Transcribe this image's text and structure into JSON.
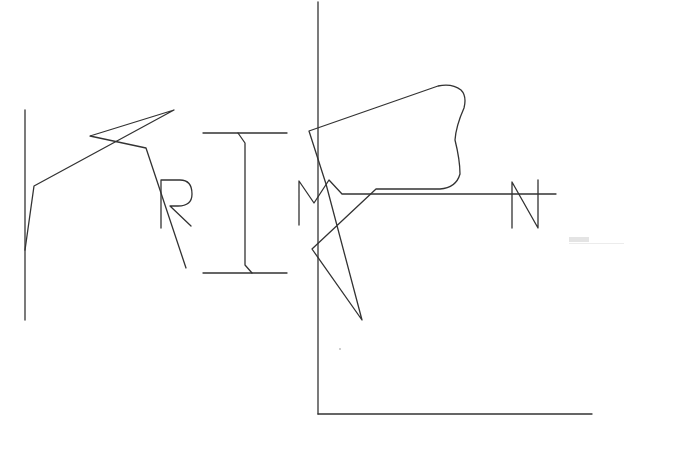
{
  "canvas": {
    "width": 700,
    "height": 458,
    "background": "#ffffff",
    "stroke_color": "#333333",
    "stroke_width": 1.3
  },
  "strokes": [
    {
      "name": "left-vertical-line",
      "d": "M25 110 L25 320"
    },
    {
      "name": "left-zigzag-stroke",
      "d": "M25 250 L34 186 L174 110 L90 136 L146 148 L186 268"
    },
    {
      "name": "letter-r",
      "d": "M161 228 L161 180 L180 180 Q192 180 192 194 Q192 206 178 206 L170 206 L191 226"
    },
    {
      "name": "letter-i-top",
      "d": "M203 133 L287 133"
    },
    {
      "name": "letter-i-stem",
      "d": "M238 133 L245 143 L245 265 L252 273"
    },
    {
      "name": "letter-i-bottom",
      "d": "M203 273 L287 273"
    },
    {
      "name": "tall-vertical-axis",
      "d": "M318 2 L318 414"
    },
    {
      "name": "bottom-horizontal-axis",
      "d": "M318 414 L592 414"
    },
    {
      "name": "letter-m",
      "d": "M299 225 L299 181 L314 203 L329 180 L342 194 L556 194"
    },
    {
      "name": "blob-outline",
      "d": "M309 131 L438 86 Q452 83 461 90 Q467 96 464 108 Q456 126 455 140 Q460 160 460 174 Q456 188 440 189 L376 189 L312 249 L362 320 L326 184 L309 131"
    },
    {
      "name": "letter-n",
      "d": "M512 228 L512 182 L538 228 L538 180"
    }
  ],
  "faint_mark": {
    "visible": true
  }
}
